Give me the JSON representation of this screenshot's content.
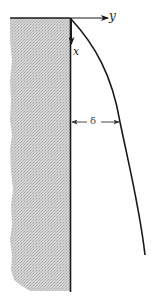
{
  "diagram": {
    "type": "boundary-layer schematic",
    "labels": {
      "y_axis": "y",
      "x_axis": "x",
      "thickness": "δ"
    },
    "elements": {
      "wall": "shaded solid plate (hatched region) with vertical surface line",
      "y_axis": "horizontal arrow pointing right from leading edge",
      "x_axis": "vertical arrow pointing down along wall",
      "boundary_layer_edge": "curve starting at origin and growing outward downstream",
      "thickness_marker": "double-headed dimension arrow between wall and curve labeled δ"
    },
    "colors": {
      "line": "#1a1a1a",
      "wall_shade": "#c8c8c8",
      "background": "#ffffff"
    }
  }
}
